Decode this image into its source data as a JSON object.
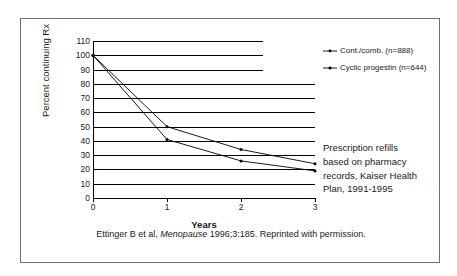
{
  "chart_data": {
    "type": "line",
    "title": "",
    "xlabel": "Years",
    "ylabel": "Percent continuing Rx",
    "x": [
      0,
      1,
      2,
      3
    ],
    "xticklabels": [
      "0",
      "1",
      "2",
      "3"
    ],
    "xlim": [
      0,
      3
    ],
    "ylim": [
      0,
      110
    ],
    "yticks": [
      0,
      10,
      20,
      30,
      40,
      50,
      60,
      70,
      80,
      90,
      100,
      110
    ],
    "yticklabels": [
      "0",
      "10",
      "20",
      "30",
      "40",
      "50",
      "60",
      "70",
      "80",
      "90",
      "100",
      "110"
    ],
    "grid": "horizontal",
    "legend_position": "top-right",
    "series": [
      {
        "name": "Cont./comb. (n=888)",
        "values": [
          100,
          50,
          34,
          24
        ],
        "color": "#000000",
        "marker": "dot"
      },
      {
        "name": "Cyclic progestin (n=644)",
        "values": [
          100,
          41,
          26,
          19
        ],
        "color": "#000000",
        "marker": "dot"
      }
    ],
    "annotations": [
      "Prescription refills based on pharmacy records, Kaiser Health Plan, 1991-1995"
    ]
  },
  "axis": {
    "ylabel": "Percent continuing Rx",
    "xlabel": "Years"
  },
  "legend": {
    "items": [
      {
        "label": "Cont./comb. (n=888)"
      },
      {
        "label": "Cyclic progestin (n=644)"
      }
    ]
  },
  "annotation": {
    "line1": "Prescription refills",
    "line2": "based on pharmacy",
    "line3": "records, Kaiser Health",
    "line4": "Plan, 1991-1995"
  },
  "caption": {
    "part1": "Ettinger B et al,",
    "journal": "Menopause",
    "part2": "1996;3:185. Reprinted with permission."
  },
  "colors": {
    "frame": "#6e6e6e",
    "line": "#000000",
    "background": "#ffffff"
  }
}
